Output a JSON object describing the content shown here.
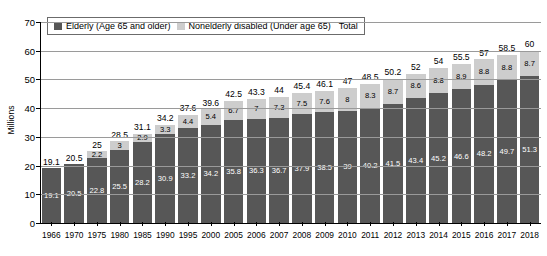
{
  "chart": {
    "type": "bar",
    "y_axis_title": "Millions",
    "y_ticks": [
      "0",
      "10",
      "20",
      "30",
      "40",
      "50",
      "60",
      "70"
    ],
    "legend": {
      "series_1_label": "Elderly (Age 65 and older)",
      "series_1_swatch": "dark-gray-swatch-icon",
      "series_2_label": "Nonelderly disabled (Under age 65)",
      "series_2_swatch": "light-gray-swatch-icon",
      "total_label": "Total"
    }
  },
  "chart_data": {
    "type": "bar",
    "title": "",
    "subtitle": "",
    "xlabel": "",
    "ylabel": "Millions",
    "ylim": [
      0,
      70
    ],
    "ytick_step": 10,
    "grid": true,
    "stacked": true,
    "legend_position": "top-left-inside",
    "colors": {
      "elderly": "#575757",
      "nonelderly_disabled": "#cdcdcd",
      "background": "#ffffff",
      "gridline": "#9a9a9a",
      "axis": "#000000"
    },
    "categories": [
      "1966",
      "1970",
      "1975",
      "1980",
      "1985",
      "1990",
      "1995",
      "2000",
      "2005",
      "2006",
      "2007",
      "2008",
      "2009",
      "2010",
      "2011",
      "2012",
      "2013",
      "2014",
      "2015",
      "2016",
      "2017",
      "2018"
    ],
    "series": [
      {
        "name": "Elderly (Age 65 and older)",
        "color": "#575757",
        "values": [
          19.1,
          20.5,
          22.8,
          25.5,
          28.2,
          30.9,
          33.2,
          34.2,
          35.8,
          36.3,
          36.7,
          37.9,
          38.5,
          39,
          40.2,
          41.5,
          43.4,
          45.2,
          46.6,
          48.2,
          49.7,
          51.3
        ]
      },
      {
        "name": "Nonelderly disabled (Under age 65)",
        "color": "#cdcdcd",
        "values": [
          null,
          null,
          2.2,
          3,
          2.9,
          3.3,
          4.4,
          5.4,
          6.7,
          7,
          7.3,
          7.5,
          7.6,
          8,
          8.3,
          8.7,
          8.6,
          8.8,
          8.9,
          8.8,
          8.8,
          8.7
        ]
      }
    ],
    "totals": [
      19.1,
      20.5,
      25,
      28.5,
      31.1,
      34.2,
      37.6,
      39.6,
      42.5,
      43.3,
      44,
      45.4,
      46.1,
      47,
      48.5,
      50.2,
      52,
      54,
      55.5,
      57,
      58.5,
      60
    ]
  }
}
